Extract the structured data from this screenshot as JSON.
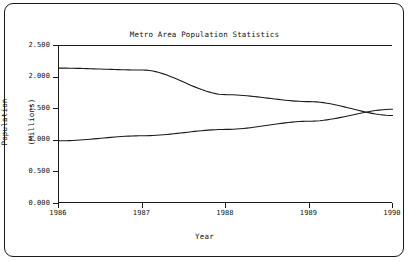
{
  "chart_data": {
    "type": "line",
    "title": "Metro Area Population Statistics",
    "subtitle": "For Steeltown and Techtown",
    "xlabel": "Year",
    "ylabel": "Population\n(Millions)",
    "ylabel_line1": "Population",
    "ylabel_line2": "(Millions)",
    "x": [
      1986,
      1987,
      1988,
      1989,
      1990
    ],
    "xlim": [
      1986,
      1990
    ],
    "ylim": [
      0.0,
      2.5
    ],
    "ytick_labels": [
      "2.500",
      "2.000",
      "1.500",
      "1.000",
      "0.500",
      "0.000"
    ],
    "ytick_values": [
      2.5,
      2.0,
      1.5,
      1.0,
      0.5,
      0.0
    ],
    "xtick_labels": [
      "1986",
      "1987",
      "1988",
      "1989",
      "1990"
    ],
    "grid": false,
    "legend": "none",
    "series": [
      {
        "name": "Steeltown",
        "color": "#1a1a1a",
        "values": [
          2.15,
          2.12,
          1.73,
          1.62,
          1.4
        ]
      },
      {
        "name": "Techtown",
        "color": "#1a1a1a",
        "values": [
          1.0,
          1.08,
          1.18,
          1.31,
          1.5
        ]
      }
    ]
  },
  "plot": {
    "left": 58,
    "top": 45,
    "width": 334,
    "height": 158
  }
}
